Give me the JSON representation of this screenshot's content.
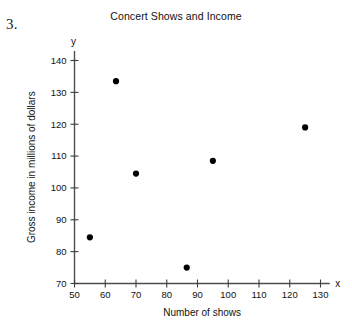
{
  "problem": {
    "number": "3."
  },
  "chart_data": {
    "type": "scatter",
    "title": "Concert Shows and Income",
    "xlabel": "Number of shows",
    "ylabel": "Gross income in millions of dollars",
    "x_axis_symbol": "x",
    "y_axis_symbol": "y",
    "xlim": [
      50,
      133
    ],
    "ylim": [
      70,
      143
    ],
    "xticks": [
      50,
      60,
      70,
      80,
      90,
      100,
      110,
      120,
      130
    ],
    "yticks": [
      70,
      80,
      90,
      100,
      110,
      120,
      130,
      140
    ],
    "xtick_labels": [
      "50",
      "60",
      "70",
      "80",
      "90",
      "100",
      "110",
      "120",
      "130"
    ],
    "ytick_labels": [
      "70",
      "80",
      "90",
      "100",
      "110",
      "120",
      "130",
      "140"
    ],
    "grid": false,
    "legend": false,
    "point_color": "#000000",
    "axis_color": "#4d4d4d",
    "points": [
      {
        "x": 55,
        "y": 84.5
      },
      {
        "x": 63.5,
        "y": 133.5
      },
      {
        "x": 70,
        "y": 104.5
      },
      {
        "x": 86.5,
        "y": 75
      },
      {
        "x": 95,
        "y": 108.5
      },
      {
        "x": 125,
        "y": 119
      }
    ]
  }
}
